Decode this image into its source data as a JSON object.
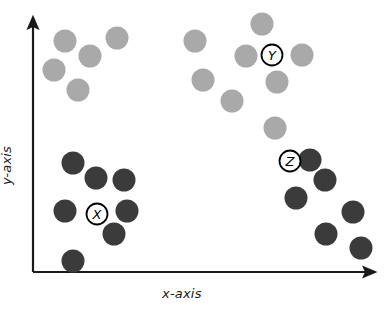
{
  "figure": {
    "title": "",
    "axes": {
      "x_label": "x-axis",
      "y_label": "y-axis",
      "x_arrow": "arrow-right",
      "y_arrow": "arrow-up",
      "origin": [
        33,
        272
      ],
      "x_end": [
        380,
        272
      ],
      "y_end": [
        33,
        14
      ],
      "line_color": "#1a1a1a"
    },
    "colors": {
      "light_point": "#a9a9a9",
      "dark_point": "#3b3b3b",
      "axis": "#1a1a1a",
      "label_ring": "#000000",
      "background": "#ffffff"
    },
    "point_radius": 11.5,
    "annotations": [
      {
        "id": "ann-x",
        "label": "X",
        "cx": 97,
        "cy": 214,
        "r": 10.5
      },
      {
        "id": "ann-y",
        "label": "Y",
        "cx": 272,
        "cy": 55,
        "r": 10.5
      },
      {
        "id": "ann-z",
        "label": "Z",
        "cx": 290,
        "cy": 161,
        "r": 10.5
      }
    ]
  },
  "chart_data": {
    "type": "scatter",
    "title": "",
    "xlabel": "x-axis",
    "ylabel": "y-axis",
    "grid": false,
    "legend": null,
    "xlim": [
      33,
      380
    ],
    "ylim": [
      14,
      272
    ],
    "note": "Pixel coordinates; y increases downward in screen space.",
    "series": [
      {
        "name": "light-cluster-upper-left",
        "color": "#a9a9a9",
        "marker": "circle",
        "points": [
          {
            "x": 65,
            "y": 41
          },
          {
            "x": 90,
            "y": 56
          },
          {
            "x": 117,
            "y": 38
          },
          {
            "x": 54,
            "y": 70
          },
          {
            "x": 78,
            "y": 90
          }
        ]
      },
      {
        "name": "light-cluster-upper-right",
        "color": "#a9a9a9",
        "marker": "circle",
        "points": [
          {
            "x": 195,
            "y": 41
          },
          {
            "x": 262,
            "y": 24
          },
          {
            "x": 246,
            "y": 56
          },
          {
            "x": 302,
            "y": 55
          },
          {
            "x": 203,
            "y": 80
          },
          {
            "x": 277,
            "y": 82
          },
          {
            "x": 232,
            "y": 101
          },
          {
            "x": 275,
            "y": 128
          }
        ]
      },
      {
        "name": "dark-cluster-lower-left",
        "color": "#3b3b3b",
        "marker": "circle",
        "points": [
          {
            "x": 73,
            "y": 163
          },
          {
            "x": 96,
            "y": 178
          },
          {
            "x": 124,
            "y": 180
          },
          {
            "x": 65,
            "y": 211
          },
          {
            "x": 127,
            "y": 211
          },
          {
            "x": 114,
            "y": 234
          },
          {
            "x": 73,
            "y": 261
          }
        ]
      },
      {
        "name": "dark-cluster-lower-right",
        "color": "#3b3b3b",
        "marker": "circle",
        "points": [
          {
            "x": 325,
            "y": 180
          },
          {
            "x": 296,
            "y": 198
          },
          {
            "x": 326,
            "y": 234
          },
          {
            "x": 353,
            "y": 212
          },
          {
            "x": 361,
            "y": 248
          },
          {
            "x": 310,
            "y": 160
          }
        ]
      }
    ]
  }
}
